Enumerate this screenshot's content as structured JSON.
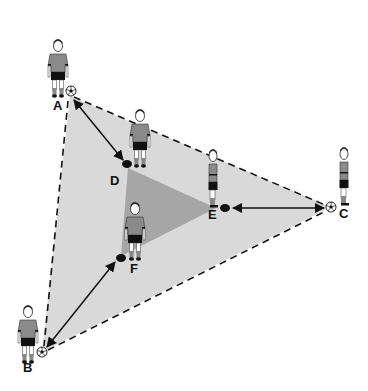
{
  "diagram": {
    "colors": {
      "outer_fill": "#d9d9d9",
      "inner_fill": "#a6a6a6",
      "line": "#111111",
      "shirt": "#8a8a8a",
      "shorts": "#111111"
    },
    "outer_triangle": {
      "vertices": [
        "A",
        "C",
        "B"
      ],
      "style": "dashed"
    },
    "inner_triangle": {
      "vertices": [
        "D",
        "E",
        "F"
      ],
      "style": "shaded"
    },
    "players": [
      {
        "id": "A",
        "label": "A",
        "role": "outer",
        "has_ball": true
      },
      {
        "id": "B",
        "label": "B",
        "role": "outer",
        "has_ball": true
      },
      {
        "id": "C",
        "label": "C",
        "role": "outer",
        "has_ball": true,
        "facing": "side"
      },
      {
        "id": "D",
        "label": "D",
        "role": "inner",
        "has_cone": true
      },
      {
        "id": "E",
        "label": "E",
        "role": "inner",
        "has_cone": true,
        "facing": "side"
      },
      {
        "id": "F",
        "label": "F",
        "role": "inner",
        "has_cone": true
      }
    ],
    "passes": [
      {
        "from": "A",
        "to": "D",
        "bidirectional": true
      },
      {
        "from": "C",
        "to": "E",
        "bidirectional": true
      },
      {
        "from": "B",
        "to": "F",
        "bidirectional": true
      }
    ],
    "labels": {
      "A": "A",
      "B": "B",
      "C": "C",
      "D": "D",
      "E": "E",
      "F": "F"
    }
  }
}
